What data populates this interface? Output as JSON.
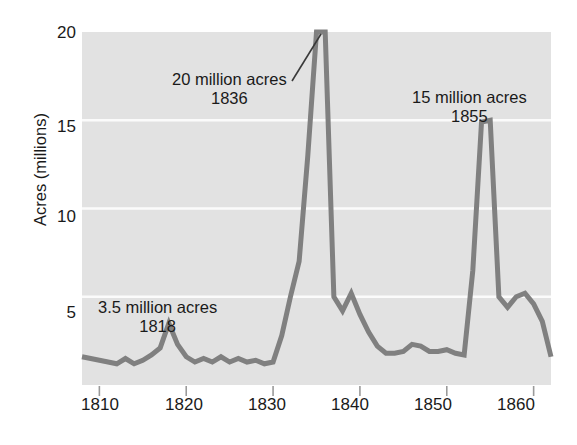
{
  "chart_data": {
    "type": "line",
    "title": "",
    "subtitle": "",
    "xlabel": "",
    "ylabel": "Acres (millions)",
    "xlim": [
      1808,
      1862
    ],
    "ylim": [
      0,
      20
    ],
    "grid": true,
    "grid_values": [
      5,
      10,
      15
    ],
    "legend": "none",
    "xticks": [
      1810,
      1820,
      1830,
      1840,
      1850,
      1860
    ],
    "xtick_labels": [
      "1810",
      "1820",
      "1830",
      "1840",
      "1850",
      "1860"
    ],
    "yticks": [
      5,
      10,
      15,
      20
    ],
    "ytick_labels": [
      "5",
      "10",
      "15",
      "20"
    ],
    "series": [
      {
        "name": "Public land sales",
        "color": "#808080",
        "x": [
          1808,
          1809,
          1810,
          1811,
          1812,
          1813,
          1814,
          1815,
          1816,
          1817,
          1818,
          1819,
          1820,
          1821,
          1822,
          1823,
          1824,
          1825,
          1826,
          1827,
          1828,
          1829,
          1830,
          1831,
          1832,
          1833,
          1834,
          1835,
          1836,
          1837,
          1838,
          1839,
          1840,
          1841,
          1842,
          1843,
          1844,
          1845,
          1846,
          1847,
          1848,
          1849,
          1850,
          1851,
          1852,
          1853,
          1854,
          1855,
          1856,
          1857,
          1858,
          1859,
          1860,
          1861,
          1862
        ],
        "values": [
          1.6,
          1.5,
          1.4,
          1.3,
          1.2,
          1.5,
          1.2,
          1.4,
          1.7,
          2.1,
          3.5,
          2.3,
          1.6,
          1.3,
          1.5,
          1.3,
          1.6,
          1.3,
          1.5,
          1.3,
          1.4,
          1.2,
          1.3,
          2.8,
          5.0,
          7.0,
          13.0,
          20.0,
          20.0,
          5.0,
          4.2,
          5.2,
          4.0,
          3.0,
          2.2,
          1.8,
          1.8,
          1.9,
          2.3,
          2.2,
          1.9,
          1.9,
          2.0,
          1.8,
          1.7,
          6.5,
          14.9,
          15.0,
          5.0,
          4.4,
          5.0,
          5.2,
          4.6,
          3.6,
          1.6
        ]
      }
    ],
    "annotations": [
      {
        "id": "peak-1836",
        "amount_label": "20 million acres",
        "year_label": "1836",
        "has_leader_line": true
      },
      {
        "id": "peak-1855",
        "amount_label": "15 million acres",
        "year_label": "1855",
        "has_leader_line": false
      },
      {
        "id": "peak-1818",
        "amount_label": "3.5 million acres",
        "year_label": "1818",
        "has_leader_line": false
      }
    ],
    "colors": {
      "line": "#808080",
      "plot_background": "#e2e2e2",
      "gridline": "#fbfbfb",
      "text": "#1a1a1a",
      "tick_mark": "#9a9a9a",
      "page_background": "#ffffff"
    }
  }
}
